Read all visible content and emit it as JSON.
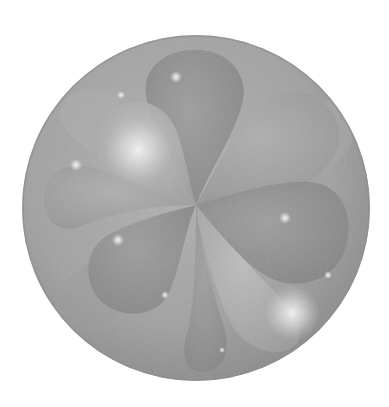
{
  "image": {
    "description": "Grayscale 3D rendering of overlapping teardrop-shaped orbital lobes enclosed in a translucent sphere",
    "background_color": "#ffffff",
    "sphere": {
      "cx": 196,
      "cy": 208,
      "rx": 174,
      "ry": 173,
      "base_color": "#a3a3a3",
      "edge_color": "#8c8c8c"
    },
    "lobes": [
      {
        "name": "top",
        "tone": "#909090"
      },
      {
        "name": "upper-left",
        "tone": "#b5b5b5"
      },
      {
        "name": "upper-right",
        "tone": "#a8a8a8"
      },
      {
        "name": "right",
        "tone": "#8f8f8f"
      },
      {
        "name": "left",
        "tone": "#a6a6a6"
      },
      {
        "name": "lower-left",
        "tone": "#9a9a9a"
      },
      {
        "name": "lower-right",
        "tone": "#b0b0b0"
      },
      {
        "name": "bottom",
        "tone": "#8a8a8a"
      }
    ],
    "highlights": [
      {
        "cx": 138,
        "cy": 150,
        "r": 34
      },
      {
        "cx": 292,
        "cy": 313,
        "r": 28
      },
      {
        "cx": 176,
        "cy": 77,
        "r": 6
      },
      {
        "cx": 285,
        "cy": 218,
        "r": 6
      },
      {
        "cx": 118,
        "cy": 240,
        "r": 6
      },
      {
        "cx": 76,
        "cy": 165,
        "r": 6
      },
      {
        "cx": 121,
        "cy": 95,
        "r": 4
      }
    ]
  }
}
